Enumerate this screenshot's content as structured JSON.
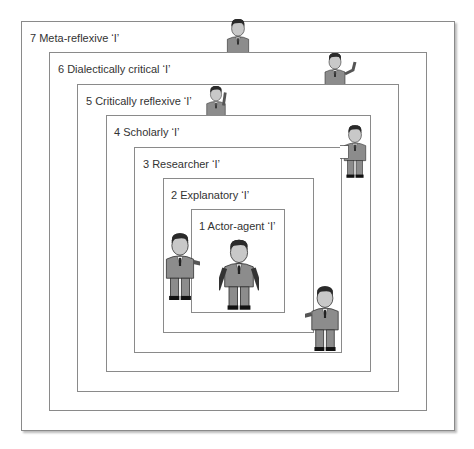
{
  "diagram": {
    "levels": [
      {
        "number": "1",
        "label": "1  Actor-agent ‘I’"
      },
      {
        "number": "2",
        "label": "2  Explanatory ‘I’"
      },
      {
        "number": "3",
        "label": "3  Researcher ‘I’"
      },
      {
        "number": "4",
        "label": "4 Scholarly ‘I’"
      },
      {
        "number": "5",
        "label": "5  Critically reflexive ‘I’"
      },
      {
        "number": "6",
        "label": "6  Dialectically critical ‘I’"
      },
      {
        "number": "7",
        "label": "7  Meta-reflexive ‘I’"
      }
    ],
    "figures": [
      {
        "id": "actor",
        "pose": "standing"
      },
      {
        "id": "explainer-left",
        "pose": "pointing-right"
      },
      {
        "id": "explainer-right",
        "pose": "pointing-left"
      },
      {
        "id": "researcher",
        "pose": "holding-paper"
      },
      {
        "id": "scratching-head",
        "pose": "hand-on-head"
      },
      {
        "id": "waving",
        "pose": "waving"
      },
      {
        "id": "meta",
        "pose": "standing"
      }
    ]
  },
  "colors": {
    "border": "#8a8a8a",
    "suit": "#8c8c8c",
    "skin": "#c8c8c8",
    "hair": "#2a2a2a"
  }
}
